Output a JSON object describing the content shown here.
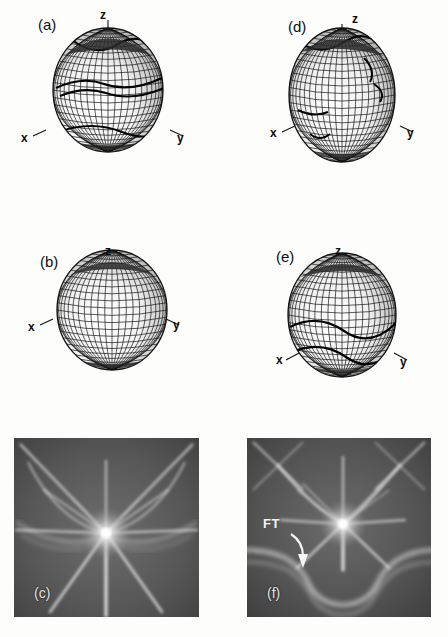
{
  "figure": {
    "kind": "scientific-figure",
    "background_color": "#fdfdfc",
    "ink_color": "#0d0d0d"
  },
  "panels": [
    {
      "id": "a",
      "label": "(a)",
      "type": "wireframe-surface",
      "axes": {
        "z": "z",
        "x": "x",
        "y": "y"
      },
      "has_contours": true,
      "shape": "rounded-faceted-sphere",
      "contour_count": 3
    },
    {
      "id": "b",
      "label": "(b)",
      "type": "wireframe-surface",
      "axes": {
        "z": "z",
        "x": "x",
        "y": "y"
      },
      "has_contours": false,
      "shape": "smooth-dome",
      "contour_count": 0
    },
    {
      "id": "c",
      "label": "(c)",
      "type": "grayscale-intensity-map",
      "background_gray": "#575757",
      "bright_color": "#ffffff",
      "features": "central starburst with six radiating rays and curved caustic arcs",
      "ray_count": 8
    },
    {
      "id": "d",
      "label": "(d)",
      "type": "wireframe-surface",
      "axes": {
        "z": "z",
        "x": "x",
        "y": "y"
      },
      "has_contours": true,
      "shape": "elongated-egg",
      "contour_count": 4
    },
    {
      "id": "e",
      "label": "(e)",
      "type": "wireframe-surface",
      "axes": {
        "z": "z",
        "x": "x",
        "y": "y"
      },
      "has_contours": true,
      "shape": "dome-with-waist",
      "contour_count": 2
    },
    {
      "id": "f",
      "label": "(f)",
      "type": "grayscale-intensity-map",
      "background_gray": "#575757",
      "bright_color": "#ffffff",
      "features": "central starburst with radiating rays plus lower bright double-lobed caustic band",
      "ray_count": 8,
      "annotation": {
        "text": "FT",
        "arrow": "curved-down-right"
      }
    }
  ],
  "colors": {
    "paper": "#fdfdfc",
    "ink": "#0d0d0d",
    "mesh": "#1a1a1a",
    "gray_panel_base": "#575757",
    "gray_panel_dark": "#3a3a3a",
    "highlight": "#ffffff",
    "annotation_text": "#f2f2f2"
  }
}
